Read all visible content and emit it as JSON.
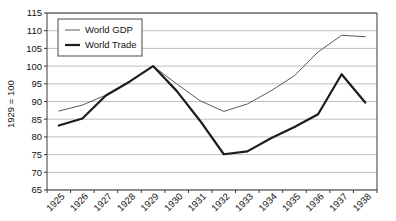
{
  "chart_data": {
    "type": "line",
    "title": "",
    "xlabel": "",
    "ylabel": "1929 = 100",
    "categories": [
      "1925",
      "1926",
      "1927",
      "1928",
      "1929",
      "1930",
      "1931",
      "1932",
      "1933",
      "1934",
      "1935",
      "1936",
      "1937",
      "1938"
    ],
    "ylim": [
      65,
      115
    ],
    "yticks": [
      65,
      70,
      75,
      80,
      85,
      90,
      95,
      100,
      105,
      110,
      115
    ],
    "grid": "horizontal",
    "legend_position": "top-left",
    "series": [
      {
        "name": "World GDP",
        "color": "#595959",
        "values": [
          87.3,
          89.0,
          91.8,
          95.6,
          100.0,
          95.0,
          90.2,
          87.2,
          89.3,
          93.0,
          97.3,
          104.0,
          108.7,
          108.3
        ]
      },
      {
        "name": "World Trade",
        "color": "#1c1c1c",
        "values": [
          83.2,
          85.2,
          91.7,
          95.6,
          100.0,
          93.0,
          84.5,
          75.1,
          75.9,
          79.6,
          82.8,
          86.4,
          97.7,
          89.7
        ]
      }
    ]
  },
  "legend": {
    "items": [
      {
        "label": "World GDP",
        "style": "thin-line"
      },
      {
        "label": "World Trade",
        "style": "thick-line"
      }
    ]
  },
  "axes": {
    "y_title": "1929 = 100",
    "y_tick_labels": [
      "115",
      "110",
      "105",
      "100",
      "95",
      "90",
      "85",
      "80",
      "75",
      "70",
      "65"
    ],
    "x_tick_labels": [
      "1925",
      "1926",
      "1927",
      "1928",
      "1929",
      "1930",
      "1931",
      "1932",
      "1933",
      "1934",
      "1935",
      "1936",
      "1937",
      "1938"
    ]
  }
}
